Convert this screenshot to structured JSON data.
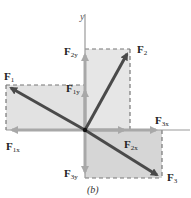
{
  "figure": {
    "caption": "(b)",
    "axis": {
      "y_label": "y"
    },
    "colors": {
      "box_fill": "#d8d8d8",
      "box_fill_light": "#e6e6e6",
      "resultant_arrow": "#4a4a4a",
      "component_arrow": "#a8a8a8",
      "axis": "#9a9a9a",
      "dashed": "#777777"
    },
    "origin": {
      "x": 85,
      "y": 130
    },
    "vectors": [
      {
        "name": "F1",
        "base": "F",
        "sub": "1",
        "tip": {
          "x": 6,
          "y": 85
        }
      },
      {
        "name": "F2",
        "base": "F",
        "sub": "2",
        "tip": {
          "x": 130,
          "y": 49
        }
      },
      {
        "name": "F3",
        "base": "F",
        "sub": "3",
        "tip": {
          "x": 162,
          "y": 178
        }
      }
    ],
    "components": [
      {
        "name": "F1x",
        "base": "F",
        "sub": "1x"
      },
      {
        "name": "F1y",
        "base": "F",
        "sub": "1y"
      },
      {
        "name": "F2x",
        "base": "F",
        "sub": "2x"
      },
      {
        "name": "F2y",
        "base": "F",
        "sub": "2y"
      },
      {
        "name": "F3x",
        "base": "F",
        "sub": "3x"
      },
      {
        "name": "F3y",
        "base": "F",
        "sub": "3y"
      }
    ]
  }
}
